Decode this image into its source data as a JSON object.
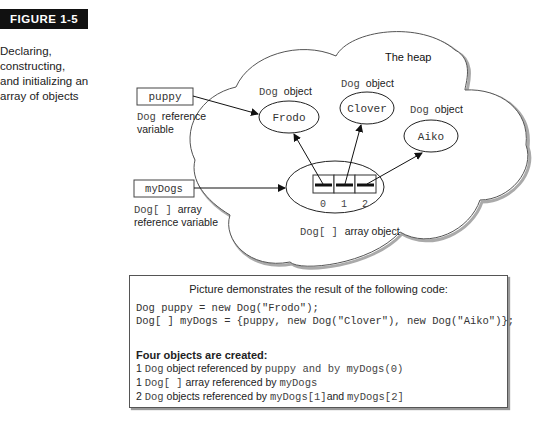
{
  "figure": {
    "label": "FIGURE 1-5",
    "caption": [
      "Declaring,",
      "constructing,",
      "and initializing an",
      "array of objects"
    ]
  },
  "diagram": {
    "heap_label": "The heap",
    "variables": [
      {
        "name": "puppy",
        "type_mono": "Dog",
        "type_text": "reference",
        "line2": "variable"
      },
      {
        "name": "myDogs",
        "type_mono": "Dog[ ]",
        "type_text": "array",
        "line2": "reference variable"
      }
    ],
    "objects": [
      {
        "value": "Frodo",
        "label_mono": "Dog",
        "label_text": "object"
      },
      {
        "value": "Clover",
        "label_mono": "Dog",
        "label_text": "object"
      },
      {
        "value": "Aiko",
        "label_mono": "Dog",
        "label_text": "object"
      }
    ],
    "array_object": {
      "indices": [
        "0",
        "1",
        "2"
      ],
      "label_mono": "Dog[ ]",
      "label_text": "array object"
    }
  },
  "code_box": {
    "title": "Picture demonstrates the result of the following code:",
    "code_lines": [
      "Dog puppy = new Dog(\"Frodo\");",
      "Dog[ ] myDogs = {puppy, new Dog(\"Clover\"), new Dog(\"Aiko\")};"
    ],
    "summary_heading": "Four objects are created:",
    "summary_lines": [
      {
        "count": "1",
        "mono1": "Dog",
        "text1": " object referenced by ",
        "mono2": "puppy and by myDogs(0)"
      },
      {
        "count": "1",
        "mono1": "Dog[ ]",
        "text1": " array referenced by ",
        "mono2": "myDogs"
      },
      {
        "count": "2",
        "mono1": "Dog",
        "text1": "  objects referenced by ",
        "mono2": "myDogs[1]",
        "text2": "and ",
        "mono3": "myDogs[2]"
      }
    ]
  }
}
